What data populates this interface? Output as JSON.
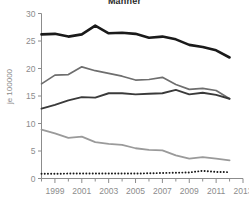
{
  "chart_data": {
    "type": "line",
    "title": "Männer",
    "subtitle": "",
    "xlabel": "",
    "ylabel": "je 100000",
    "xlim": [
      1998,
      2013
    ],
    "ylim": [
      0,
      30
    ],
    "grid": false,
    "legend": "none",
    "x": [
      1998,
      1999,
      2000,
      2001,
      2002,
      2003,
      2004,
      2005,
      2006,
      2007,
      2008,
      2009,
      2010,
      2011,
      2012
    ],
    "xticks": [
      1999,
      2001,
      2003,
      2005,
      2007,
      2009,
      2011,
      2013
    ],
    "xtick_labels": [
      "1999",
      "2001",
      "2003",
      "2005",
      "2007",
      "2009",
      "2011",
      "2013"
    ],
    "xminorticks": [
      1998,
      2000,
      2002,
      2004,
      2006,
      2008,
      2010,
      2012
    ],
    "yticks": [
      0,
      5,
      10,
      15,
      20,
      25,
      30
    ],
    "ytick_labels": [
      "0",
      "5",
      "10",
      "15",
      "20",
      "25",
      "30"
    ],
    "series": [
      {
        "name": "series-1-thick-black",
        "color": "#1a1a1a",
        "width": 2.6,
        "dash": "none",
        "values": [
          26.2,
          26.3,
          25.8,
          26.2,
          27.8,
          26.4,
          26.5,
          26.3,
          25.6,
          25.8,
          25.3,
          24.3,
          23.9,
          23.3,
          22.0
        ]
      },
      {
        "name": "series-2-medium-gray",
        "color": "#6e6e6e",
        "width": 1.7,
        "dash": "none",
        "values": [
          17.2,
          18.8,
          18.9,
          20.3,
          19.6,
          19.1,
          18.6,
          17.9,
          18.0,
          18.4,
          17.1,
          16.2,
          16.4,
          16.0,
          14.5
        ]
      },
      {
        "name": "series-3-dark-gray",
        "color": "#3a3a3a",
        "width": 1.9,
        "dash": "none",
        "values": [
          12.7,
          13.4,
          14.2,
          14.8,
          14.7,
          15.5,
          15.5,
          15.3,
          15.4,
          15.5,
          16.1,
          15.3,
          15.6,
          15.2,
          14.5
        ]
      },
      {
        "name": "series-4-light-gray",
        "color": "#9a9a9a",
        "width": 1.8,
        "dash": "none",
        "values": [
          8.9,
          8.2,
          7.4,
          7.6,
          6.6,
          6.3,
          6.1,
          5.5,
          5.2,
          5.1,
          4.2,
          3.6,
          3.9,
          3.6,
          3.3
        ]
      },
      {
        "name": "series-5-dotted-black",
        "color": "#1a1a1a",
        "width": 1.9,
        "dash": "0.1,3.1",
        "values": [
          0.85,
          0.85,
          0.9,
          0.9,
          0.9,
          0.9,
          0.9,
          0.9,
          0.95,
          1.0,
          1.05,
          1.1,
          1.4,
          1.2,
          1.15
        ]
      }
    ]
  }
}
